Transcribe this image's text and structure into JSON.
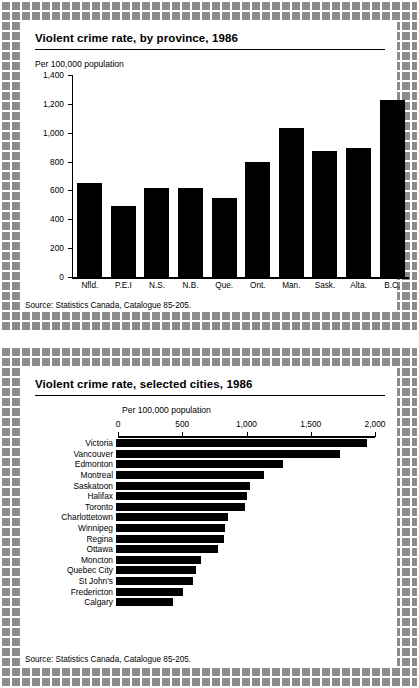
{
  "figure": {
    "panels": [
      {
        "id": "provinces",
        "title": "Violent crime rate, by province, 1986",
        "axis_caption": "Per 100,000 population",
        "source": "Source: Statistics Canada, Catalogue 85-205."
      },
      {
        "id": "cities",
        "title": "Violent crime rate, selected cities, 1986",
        "axis_caption": "Per 100,000 population",
        "source": "Source: Statistics Canada, Catalogue 85-205."
      }
    ]
  },
  "chart_data": [
    {
      "type": "bar",
      "orientation": "vertical",
      "title": "Violent crime rate, by province, 1986",
      "xlabel": "",
      "ylabel": "Per 100,000 population",
      "ylim": [
        0,
        1400
      ],
      "yticks": [
        0,
        200,
        400,
        600,
        800,
        1000,
        1200,
        1400
      ],
      "ytick_labels": [
        "0",
        "200",
        "400",
        "600",
        "800",
        "1,000",
        "1,200",
        "1,400"
      ],
      "grid": false,
      "legend": "none",
      "bar_color": "#000000",
      "categories": [
        "Nfld.",
        "P.E.I",
        "N.S.",
        "N.B.",
        "Que.",
        "Ont.",
        "Man.",
        "Sask.",
        "Alta.",
        "B.C."
      ],
      "values": [
        650,
        490,
        620,
        615,
        545,
        795,
        1030,
        870,
        895,
        1230
      ],
      "source": "Source: Statistics Canada, Catalogue 85-205."
    },
    {
      "type": "bar",
      "orientation": "horizontal",
      "title": "Violent crime rate, selected cities, 1986",
      "xlabel": "Per 100,000 population",
      "ylabel": "",
      "xlim": [
        0,
        2000
      ],
      "xticks": [
        0,
        500,
        1000,
        1500,
        2000
      ],
      "xtick_labels": [
        "0",
        "500",
        "1,000",
        "1,500",
        "2,000"
      ],
      "grid": false,
      "legend": "none",
      "bar_color": "#000000",
      "categories": [
        "Victoria",
        "Vancouver",
        "Edmonton",
        "Montreal",
        "Saskatoon",
        "Halifax",
        "Toronto",
        "Charlottetown",
        "Winnipeg",
        "Regina",
        "Ottawa",
        "Moncton",
        "Quebec City",
        "St John's",
        "Fredericton",
        "Calgary"
      ],
      "values": [
        1950,
        1740,
        1300,
        1150,
        1040,
        1020,
        1000,
        870,
        850,
        840,
        790,
        660,
        620,
        600,
        520,
        440
      ],
      "source": "Source: Statistics Canada, Catalogue 85-205."
    }
  ]
}
